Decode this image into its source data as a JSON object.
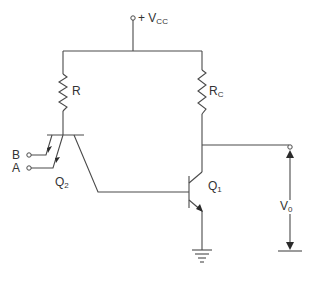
{
  "diagram": {
    "supply": {
      "label": "+ V",
      "sub": "CC"
    },
    "resistors": [
      {
        "id": "R",
        "label": "R",
        "sub": ""
      },
      {
        "id": "Rc",
        "label": "R",
        "sub": "C"
      }
    ],
    "transistors": [
      {
        "id": "Q2",
        "label": "Q",
        "sub": "2",
        "type": "multi-emitter NPN"
      },
      {
        "id": "Q1",
        "label": "Q",
        "sub": "1",
        "type": "NPN"
      }
    ],
    "inputs": [
      {
        "id": "B",
        "label": "B"
      },
      {
        "id": "A",
        "label": "A"
      }
    ],
    "output": {
      "label": "V",
      "sub": "0"
    },
    "ground": "ground-symbol",
    "colors": {
      "wire": "#4a4a4a",
      "text": "#333333",
      "background": "#ffffff"
    }
  }
}
